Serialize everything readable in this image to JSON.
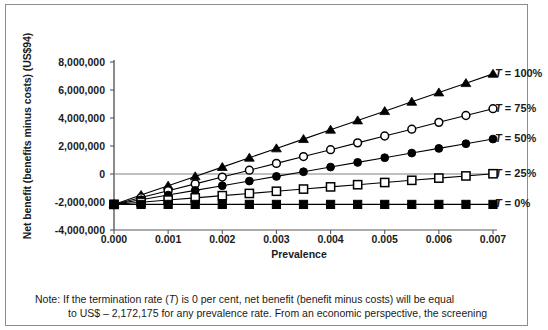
{
  "chart_data": {
    "type": "line",
    "title": "",
    "xlabel": "Prevalence",
    "ylabel": "Net benefit (benefits minus costs) (US$94)",
    "xlim": [
      0.0,
      0.007
    ],
    "ylim": [
      -4000000,
      8000000
    ],
    "grid": false,
    "zero_line": true,
    "legend_position": "right-inline",
    "x": [
      0.0,
      0.0005,
      0.001,
      0.0015,
      0.002,
      0.0025,
      0.003,
      0.0035,
      0.004,
      0.0045,
      0.005,
      0.0055,
      0.006,
      0.0065,
      0.007
    ],
    "xticks": [
      "0.000",
      "0.001",
      "0.002",
      "0.003",
      "0.004",
      "0.005",
      "0.006",
      "0.007"
    ],
    "xtick_values": [
      0.0,
      0.001,
      0.002,
      0.003,
      0.004,
      0.005,
      0.006,
      0.007
    ],
    "yticks": [
      "8,000,000",
      "6,000,000",
      "4,000,000",
      "2,000,000",
      "0",
      "-2,000,000",
      "-4,000,000"
    ],
    "ytick_values": [
      8000000,
      6000000,
      4000000,
      2000000,
      0,
      -2000000,
      -4000000
    ],
    "series": [
      {
        "name": "T = 100%",
        "label_prefix": "T",
        "label_suffix": " = 100%",
        "marker": "filled-triangle",
        "color": "#000000",
        "values": [
          -2172175,
          -1506175,
          -840175,
          -174175,
          491825,
          1157825,
          1823825,
          2489825,
          3155825,
          3821825,
          4487825,
          5153825,
          5819825,
          6485825,
          7151825
        ]
      },
      {
        "name": "T = 75%",
        "label_prefix": "T",
        "label_suffix": " = 75%",
        "marker": "open-circle",
        "color": "#000000",
        "values": [
          -2172175,
          -1683675,
          -1195175,
          -706675,
          -218175,
          270325,
          758825,
          1247325,
          1735825,
          2224325,
          2712825,
          3201325,
          3689825,
          4178325,
          4666825
        ]
      },
      {
        "name": "T = 50%",
        "label_prefix": "T",
        "label_suffix": " = 50%",
        "marker": "filled-circle",
        "color": "#000000",
        "values": [
          -2172175,
          -1838675,
          -1505175,
          -1171675,
          -838175,
          -504675,
          -171175,
          162325,
          495825,
          829325,
          1162825,
          1496325,
          1829825,
          2163325,
          2496825
        ]
      },
      {
        "name": "T = 25%",
        "label_prefix": "T",
        "label_suffix": " = 25%",
        "marker": "open-square",
        "color": "#000000",
        "values": [
          -2172175,
          -2015675,
          -1859175,
          -1702675,
          -1546175,
          -1389675,
          -1233175,
          -1076675,
          -920175,
          -763675,
          -607175,
          -450675,
          -294175,
          -137675,
          18825
        ]
      },
      {
        "name": "T = 0%",
        "label_prefix": "T",
        "label_suffix": " = 0%",
        "marker": "filled-square",
        "color": "#000000",
        "values": [
          -2172175,
          -2172175,
          -2172175,
          -2172175,
          -2172175,
          -2172175,
          -2172175,
          -2172175,
          -2172175,
          -2172175,
          -2172175,
          -2172175,
          -2172175,
          -2172175,
          -2172175
        ]
      }
    ]
  },
  "note": {
    "line1_prefix": "Note: If the termination rate (",
    "line1_italic": "T",
    "line1_suffix": ") is 0 per cent, net benefit (benefit minus costs) will be equal",
    "line2": "to US$ – 2,172,175 for any prevalence rate. From an economic perspective, the screening"
  }
}
